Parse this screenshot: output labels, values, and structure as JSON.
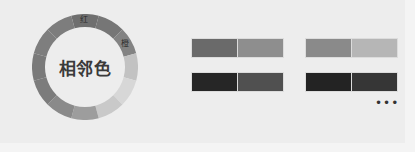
{
  "title": "相邻色",
  "wheel": {
    "segments": [
      {
        "name": "红",
        "color": "#6f6f6f",
        "label": "红"
      },
      {
        "name": "红橙",
        "color": "#767676",
        "label": ""
      },
      {
        "name": "橙",
        "color": "#838383",
        "label": "橙"
      },
      {
        "name": "黄橙",
        "color": "#c2c2c2",
        "label": ""
      },
      {
        "name": "黄",
        "color": "#d7d7d7",
        "label": ""
      },
      {
        "name": "黄绿",
        "color": "#c9c9c9",
        "label": ""
      },
      {
        "name": "绿",
        "color": "#9d9d9d",
        "label": ""
      },
      {
        "name": "蓝绿",
        "color": "#8a8a8a",
        "label": ""
      },
      {
        "name": "蓝",
        "color": "#7c7c7c",
        "label": ""
      },
      {
        "name": "蓝紫",
        "color": "#7a7a7a",
        "label": ""
      },
      {
        "name": "紫",
        "color": "#7e7e7e",
        "label": ""
      },
      {
        "name": "红紫",
        "color": "#7d7d7d",
        "label": ""
      }
    ]
  },
  "swatch_pairs": [
    {
      "left": "#6a6a6a",
      "right": "#8e8e8e"
    },
    {
      "left": "#8a8a8a",
      "right": "#b6b6b6"
    },
    {
      "left": "#262626",
      "right": "#505050"
    },
    {
      "left": "#232323",
      "right": "#363636"
    }
  ],
  "more_label": "•••"
}
